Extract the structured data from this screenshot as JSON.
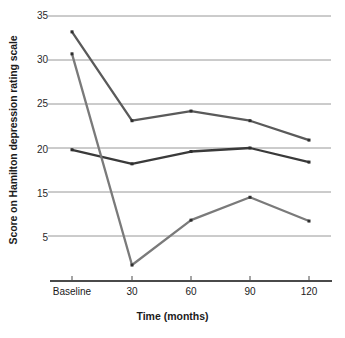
{
  "chart_data": {
    "type": "line",
    "title": "",
    "xlabel": "Time (months)",
    "ylabel": "Score on Hamilton depression rating scale",
    "categories": [
      "Baseline",
      "30",
      "60",
      "90",
      "120"
    ],
    "x": [
      0,
      30,
      60,
      90,
      120
    ],
    "ylim": [
      5,
      35
    ],
    "yticks": [
      35,
      30,
      25,
      20,
      15,
      5
    ],
    "ytick_labels": [
      "35",
      "30",
      "25",
      "20",
      "15",
      "5"
    ],
    "grid": "horizontal",
    "legend": "none",
    "series": [
      {
        "name": "series-1-steep-decline",
        "color": "#5a5a5a",
        "values": [
          33.2,
          23.1,
          24.2,
          23.1,
          20.9
        ]
      },
      {
        "name": "series-2-flat",
        "color": "#3a3a3a",
        "values": [
          19.8,
          18.2,
          19.6,
          20.0,
          18.4
        ]
      },
      {
        "name": "series-3-lowest",
        "color": "#7a7a7a",
        "values": [
          30.7,
          6.7,
          11.8,
          14.4,
          11.7
        ]
      }
    ],
    "gridline_color": "#8c8c8c",
    "axis_color": "#4a4a4a",
    "marker": "square-dot"
  },
  "axes": {
    "y_title": "Score on Hamilton depression rating scale",
    "x_title": "Time (months)",
    "y_tick_0": "35",
    "y_tick_1": "30",
    "y_tick_2": "25",
    "y_tick_3": "20",
    "y_tick_4": "15",
    "y_tick_5": "5",
    "x_tick_0": "Baseline",
    "x_tick_1": "30",
    "x_tick_2": "60",
    "x_tick_3": "90",
    "x_tick_4": "120"
  }
}
